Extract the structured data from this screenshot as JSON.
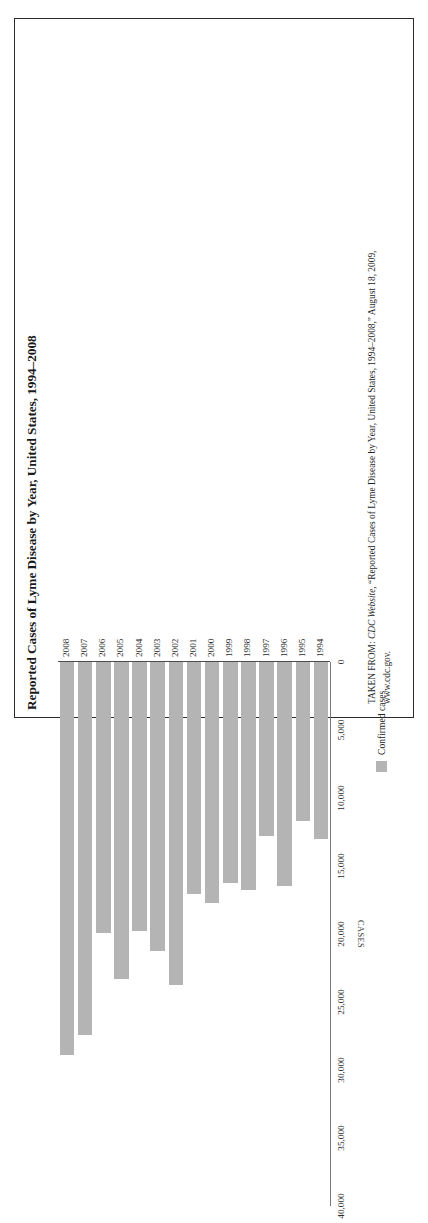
{
  "figure": {
    "title": "Reported Cases of Lyme Disease by Year, United States, 1994–2008",
    "legend_label": "Confirmed cases",
    "value_axis_title": "CASES",
    "source_prefix": "TAKEN FROM: ",
    "source_publication": "CDC Website",
    "source_rest": ", “Reported Cases of Lyme Disease by Year, United States, 1994–2008,” August 18, 2009,",
    "source_url": "www.cdc.gov.",
    "bar_color": "#b4b4b4",
    "frame_color": "#2b2b2b"
  },
  "chart_data": {
    "type": "bar",
    "title": "Reported Cases of Lyme Disease by Year, United States, 1994–2008",
    "xlabel": "",
    "ylabel": "CASES",
    "orientation": "vertical-rotated",
    "grid": false,
    "legend_position": "below-axis",
    "series": [
      {
        "name": "Confirmed cases",
        "values": [
          13043,
          11700,
          16455,
          12801,
          16802,
          16273,
          17730,
          17029,
          23763,
          21273,
          19804,
          23305,
          19931,
          27444,
          28921
        ]
      }
    ],
    "categories": [
      "1994",
      "1995",
      "1996",
      "1997",
      "1998",
      "1999",
      "2000",
      "2001",
      "2002",
      "2003",
      "2004",
      "2005",
      "2006",
      "2007",
      "2008"
    ],
    "tick_labels": [
      "0",
      "5,000",
      "10,000",
      "15,000",
      "20,000",
      "25,000",
      "30,000",
      "35,000",
      "40,000"
    ],
    "tick_values": [
      0,
      5000,
      10000,
      15000,
      20000,
      25000,
      30000,
      35000,
      40000
    ],
    "ylim": [
      0,
      40000
    ]
  }
}
